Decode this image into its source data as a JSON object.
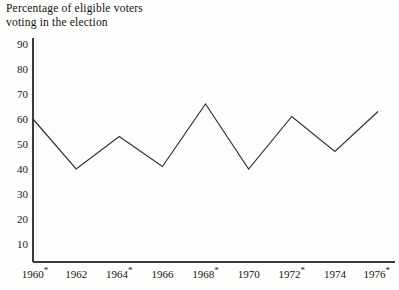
{
  "chart_data": {
    "type": "line",
    "title": "Percentage of eligible voters\nvoting in the election",
    "xlabel": "",
    "ylabel": "",
    "categories": [
      "1960*",
      "1962",
      "1964*",
      "1966",
      "1968*",
      "1970",
      "1972*",
      "1974",
      "1976*"
    ],
    "x": [
      1960,
      1962,
      1964,
      1966,
      1968,
      1970,
      1972,
      1974,
      1976
    ],
    "values": [
      60,
      40,
      53,
      41,
      66,
      40,
      61,
      47,
      63
    ],
    "series": [
      {
        "name": "Percentage of eligible voters voting in the election",
        "values": [
          60,
          40,
          53,
          41,
          66,
          40,
          61,
          47,
          63
        ]
      }
    ],
    "ylim": [
      0,
      95
    ],
    "yticks": [
      90,
      80,
      70,
      60,
      50,
      40,
      30,
      20,
      10
    ],
    "ytick_labels": [
      "90",
      "80",
      "70",
      "60",
      "50",
      "40",
      "30",
      "20",
      "10"
    ],
    "xtick_labels": [
      "1960*",
      "1962",
      "1964*",
      "1966",
      "1968*",
      "1970",
      "1972*",
      "1974",
      "1976*"
    ],
    "grid": false,
    "legend": "none",
    "annotations": [
      "* marks presidential election years"
    ],
    "line_color": "#2f2f2f",
    "axis_color": "#3a3a3a",
    "background_color": "#fdfdfb"
  }
}
